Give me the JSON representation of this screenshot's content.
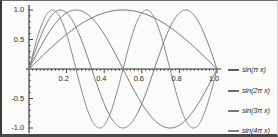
{
  "chart_data": {
    "type": "line",
    "title": "",
    "xlabel": "",
    "ylabel": "",
    "xlim": [
      0,
      1
    ],
    "ylim": [
      -1,
      1
    ],
    "grid": false,
    "legend_position": "right",
    "x_ticks": [
      {
        "value": 0.2,
        "label": "0.2"
      },
      {
        "value": 0.4,
        "label": "0.4"
      },
      {
        "value": 0.6,
        "label": "0.6"
      },
      {
        "value": 0.8,
        "label": "0.8"
      },
      {
        "value": 1.0,
        "label": "1.0"
      }
    ],
    "y_ticks": [
      {
        "value": 1.0,
        "label": "1.0"
      },
      {
        "value": 0.5,
        "label": "0.5"
      },
      {
        "value": -0.5,
        "label": "-0.5"
      },
      {
        "value": -1.0,
        "label": "-1.0"
      }
    ],
    "series": [
      {
        "name": "sin(π x)",
        "color": "#5b5b5b",
        "frequency": 1,
        "x": [
          0,
          0.05,
          0.1,
          0.15,
          0.2,
          0.25,
          0.3,
          0.35,
          0.4,
          0.45,
          0.5,
          0.55,
          0.6,
          0.65,
          0.7,
          0.75,
          0.8,
          0.85,
          0.9,
          0.95,
          1
        ],
        "values": [
          0,
          0.156,
          0.309,
          0.454,
          0.588,
          0.707,
          0.809,
          0.891,
          0.951,
          0.988,
          1,
          0.988,
          0.951,
          0.891,
          0.809,
          0.707,
          0.588,
          0.454,
          0.309,
          0.156,
          0
        ]
      },
      {
        "name": "sin(2π x)",
        "color": "#6a6a6a",
        "frequency": 2,
        "x": [
          0,
          0.05,
          0.1,
          0.15,
          0.2,
          0.25,
          0.3,
          0.35,
          0.4,
          0.45,
          0.5,
          0.55,
          0.6,
          0.65,
          0.7,
          0.75,
          0.8,
          0.85,
          0.9,
          0.95,
          1
        ],
        "values": [
          0,
          0.309,
          0.588,
          0.809,
          0.951,
          1,
          0.951,
          0.809,
          0.588,
          0.309,
          0,
          -0.309,
          -0.588,
          -0.809,
          -0.951,
          -1,
          -0.951,
          -0.809,
          -0.588,
          -0.309,
          0
        ]
      },
      {
        "name": "sin(3π x)",
        "color": "#767676",
        "frequency": 3,
        "x": [
          0,
          0.05,
          0.1,
          0.15,
          0.2,
          0.25,
          0.3,
          0.35,
          0.4,
          0.45,
          0.5,
          0.55,
          0.6,
          0.65,
          0.7,
          0.75,
          0.8,
          0.85,
          0.9,
          0.95,
          1
        ],
        "values": [
          0,
          0.454,
          0.809,
          0.988,
          0.951,
          0.707,
          0.309,
          -0.156,
          -0.588,
          -0.891,
          -1,
          -0.891,
          -0.588,
          -0.156,
          0.309,
          0.707,
          0.951,
          0.988,
          0.809,
          0.454,
          0
        ]
      },
      {
        "name": "sin(4π x)",
        "color": "#848484",
        "frequency": 4,
        "x": [
          0,
          0.05,
          0.1,
          0.15,
          0.2,
          0.25,
          0.3,
          0.35,
          0.4,
          0.45,
          0.5,
          0.55,
          0.6,
          0.65,
          0.7,
          0.75,
          0.8,
          0.85,
          0.9,
          0.95,
          1
        ],
        "values": [
          0,
          0.588,
          0.951,
          0.951,
          0.588,
          0,
          -0.588,
          -0.951,
          -0.951,
          -0.588,
          0,
          0.588,
          0.951,
          0.951,
          0.588,
          0,
          -0.588,
          -0.951,
          -0.951,
          -0.588,
          0
        ]
      }
    ]
  },
  "axes": {
    "x_tick_labels": [
      "0.2",
      "0.4",
      "0.6",
      "0.8",
      "1.0"
    ],
    "y_tick_labels": [
      "1.0",
      "0.5",
      "-0.5",
      "-1.0"
    ]
  },
  "legend": {
    "items": [
      {
        "label": "sin(π x)",
        "color": "#5b5b5b"
      },
      {
        "label": "sin(2π x)",
        "color": "#6a6a6a"
      },
      {
        "label": "sin(3π x)",
        "color": "#767676"
      },
      {
        "label": "sin(4π x)",
        "color": "#848484"
      }
    ]
  }
}
